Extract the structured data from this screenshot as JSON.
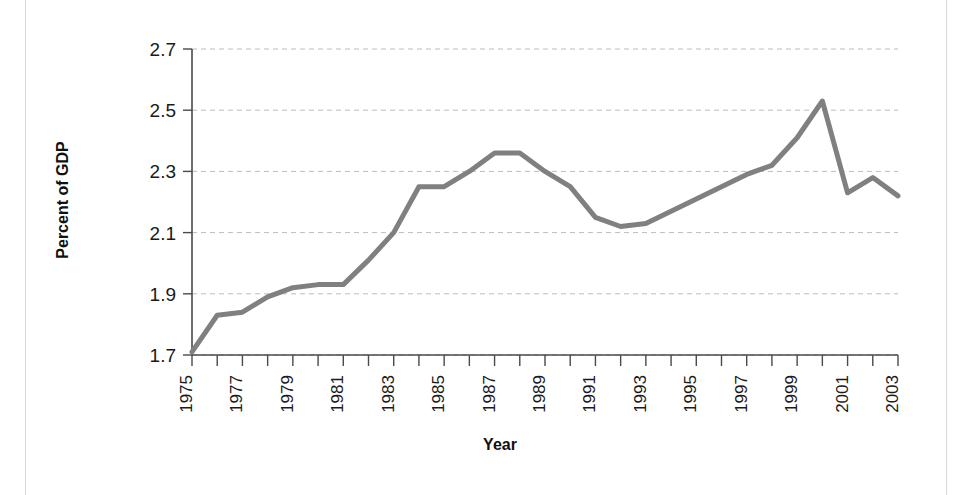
{
  "chart_data": {
    "type": "line",
    "title": "",
    "xlabel": "Year",
    "ylabel": "Percent of GDP",
    "xlim": [
      1975,
      2003
    ],
    "ylim": [
      1.7,
      2.7
    ],
    "grid": true,
    "legend": "none",
    "line_color": "#808080",
    "x": [
      1975,
      1976,
      1977,
      1978,
      1979,
      1980,
      1981,
      1982,
      1983,
      1984,
      1985,
      1986,
      1987,
      1988,
      1989,
      1990,
      1991,
      1992,
      1993,
      1994,
      1995,
      1996,
      1997,
      1998,
      1999,
      2000,
      2001,
      2002,
      2003
    ],
    "values": [
      1.71,
      1.83,
      1.84,
      1.89,
      1.92,
      1.93,
      1.93,
      2.01,
      2.1,
      2.25,
      2.25,
      2.3,
      2.36,
      2.36,
      2.3,
      2.25,
      2.15,
      2.12,
      2.13,
      2.17,
      2.21,
      2.25,
      2.29,
      2.32,
      2.41,
      2.53,
      2.23,
      2.28,
      2.22
    ],
    "ytick_labels": [
      "1.7",
      "1.9",
      "2.1",
      "2.3",
      "2.5",
      "2.7"
    ],
    "ytick_values": [
      1.7,
      1.9,
      2.1,
      2.3,
      2.5,
      2.7
    ],
    "xtick_labels": [
      "1975",
      "1977",
      "1979",
      "1981",
      "1983",
      "1985",
      "1987",
      "1989",
      "1991",
      "1993",
      "1995",
      "1997",
      "1999",
      "2001",
      "2003"
    ],
    "xtick_values": [
      1975,
      1977,
      1979,
      1981,
      1983,
      1985,
      1987,
      1989,
      1991,
      1993,
      1995,
      1997,
      1999,
      2001,
      2003
    ]
  }
}
